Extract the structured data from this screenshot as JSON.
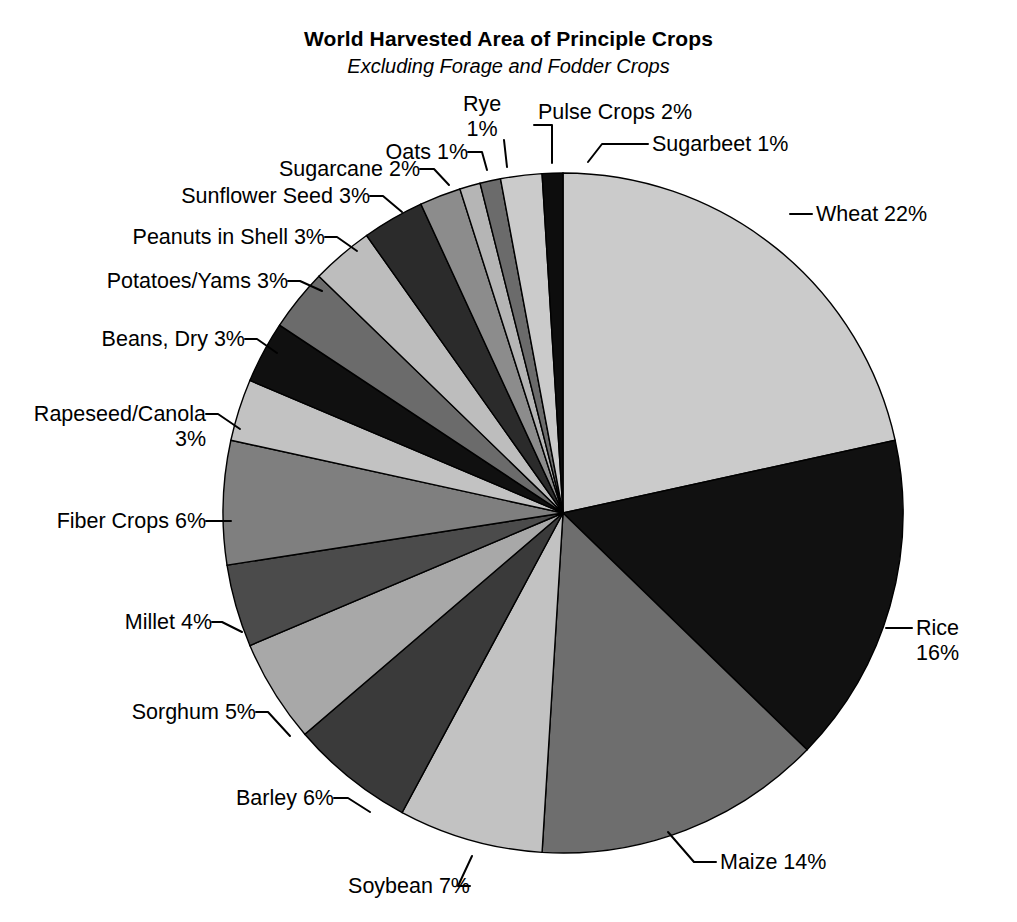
{
  "chart_data": {
    "type": "pie",
    "title": "World Harvested Area of Principle Crops",
    "subtitle": "Excluding Forage and Fodder Crops",
    "units": "percent of world harvested area",
    "legend": "none (direct labels with leader lines)",
    "grid": false,
    "start_angle_deg": 0,
    "direction": "clockwise",
    "categories": [
      "Wheat",
      "Rice",
      "Maize",
      "Soybean",
      "Barley",
      "Sorghum",
      "Millet",
      "Fiber Crops",
      "Rapeseed/Canola",
      "Beans, Dry",
      "Potatoes/Yams",
      "Peanuts in Shell",
      "Sunflower Seed",
      "Sugarcane",
      "Oats",
      "Rye",
      "Pulse Crops",
      "Sugarbeet"
    ],
    "values": [
      22,
      16,
      14,
      7,
      6,
      5,
      4,
      6,
      3,
      3,
      3,
      3,
      3,
      2,
      1,
      1,
      2,
      1
    ],
    "slices": [
      {
        "name": "Wheat",
        "value": 22,
        "label": "Wheat 22%",
        "fill": "#cbcbcb"
      },
      {
        "name": "Rice",
        "value": 16,
        "label": "Rice",
        "label2": "16%",
        "fill": "#111111"
      },
      {
        "name": "Maize",
        "value": 14,
        "label": "Maize 14%",
        "fill": "#6e6e6e"
      },
      {
        "name": "Soybean",
        "value": 7,
        "label": "Soybean 7%",
        "fill": "#c2c2c2"
      },
      {
        "name": "Barley",
        "value": 6,
        "label": "Barley 6%",
        "fill": "#3a3a3a"
      },
      {
        "name": "Sorghum",
        "value": 5,
        "label": "Sorghum 5%",
        "fill": "#a8a8a8"
      },
      {
        "name": "Millet",
        "value": 4,
        "label": "Millet 4%",
        "fill": "#4b4b4b"
      },
      {
        "name": "Fiber Crops",
        "value": 6,
        "label": "Fiber Crops 6%",
        "fill": "#7f7f7f"
      },
      {
        "name": "Rapeseed/Canola",
        "value": 3,
        "label": "Rapeseed/Canola",
        "label2": "3%",
        "fill": "#c2c2c2"
      },
      {
        "name": "Beans, Dry",
        "value": 3,
        "label": "Beans, Dry 3%",
        "fill": "#101010"
      },
      {
        "name": "Potatoes/Yams",
        "value": 3,
        "label": "Potatoes/Yams 3%",
        "fill": "#6b6b6b"
      },
      {
        "name": "Peanuts in Shell",
        "value": 3,
        "label": "Peanuts in Shell 3%",
        "fill": "#bdbdbd"
      },
      {
        "name": "Sunflower Seed",
        "value": 3,
        "label": "Sunflower Seed 3%",
        "fill": "#2b2b2b"
      },
      {
        "name": "Sugarcane",
        "value": 2,
        "label": "Sugarcane 2%",
        "fill": "#8c8c8c"
      },
      {
        "name": "Oats",
        "value": 1,
        "label": "Oats 1%",
        "fill": "#b5b5b5"
      },
      {
        "name": "Rye",
        "value": 1,
        "label": "Rye",
        "label2": "1%",
        "fill": "#6b6b6b"
      },
      {
        "name": "Pulse Crops",
        "value": 2,
        "label": "Pulse Crops 2%",
        "fill": "#cbcbcb"
      },
      {
        "name": "Sugarbeet",
        "value": 1,
        "label": "Sugarbeet 1%",
        "fill": "#0d0d0d"
      }
    ]
  },
  "labels": {
    "wheat": {
      "text": "Wheat 22%"
    },
    "rice_line1": {
      "text": "Rice"
    },
    "rice_line2": {
      "text": "16%"
    },
    "maize": {
      "text": "Maize 14%"
    },
    "soybean": {
      "text": "Soybean 7%"
    },
    "barley": {
      "text": "Barley 6%"
    },
    "sorghum": {
      "text": "Sorghum 5%"
    },
    "millet": {
      "text": "Millet 4%"
    },
    "fiber_crops": {
      "text": "Fiber Crops 6%"
    },
    "rapeseed_line1": {
      "text": "Rapeseed/Canola"
    },
    "rapeseed_line2": {
      "text": "3%"
    },
    "beans_dry": {
      "text": "Beans, Dry 3%"
    },
    "potatoes_yams": {
      "text": "Potatoes/Yams 3%"
    },
    "peanuts": {
      "text": "Peanuts in Shell 3%"
    },
    "sunflower": {
      "text": "Sunflower Seed 3%"
    },
    "sugarcane": {
      "text": "Sugarcane 2%"
    },
    "oats": {
      "text": "Oats 1%"
    },
    "rye_line1": {
      "text": "Rye"
    },
    "rye_line2": {
      "text": "1%"
    },
    "pulse_crops": {
      "text": "Pulse Crops 2%"
    },
    "sugarbeet": {
      "text": "Sugarbeet 1%"
    }
  }
}
